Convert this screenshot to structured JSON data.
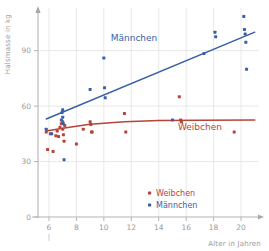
{
  "chart_data": {
    "type": "scatter",
    "title": "",
    "xlabel": "Alter in Jahren",
    "ylabel": "Halsmasse in kg",
    "xlim": [
      5.2,
      21.6
    ],
    "ylim": [
      0,
      112
    ],
    "xticks": [
      6,
      8,
      10,
      12,
      14,
      16,
      18,
      20
    ],
    "yticks": [
      0,
      30,
      60,
      90
    ],
    "grid": true,
    "legend_position": "bottom-center",
    "series": [
      {
        "name": "Weibchen",
        "color": "#b8433a",
        "marker": "square-dot",
        "annotation": "Weibchen",
        "annotation_x": 17.0,
        "annotation_y": 47.0,
        "points": [
          [
            5.8,
            46.0
          ],
          [
            5.9,
            36.5
          ],
          [
            6.1,
            45.0
          ],
          [
            6.3,
            35.5
          ],
          [
            6.5,
            44.0
          ],
          [
            6.6,
            46.5
          ],
          [
            6.7,
            43.5
          ],
          [
            6.8,
            48.5
          ],
          [
            6.9,
            50.5
          ],
          [
            7.0,
            51.5
          ],
          [
            7.0,
            47.5
          ],
          [
            7.05,
            44.5
          ],
          [
            7.1,
            41.0
          ],
          [
            7.15,
            49.5
          ],
          [
            8.0,
            39.5
          ],
          [
            8.5,
            47.5
          ],
          [
            9.0,
            51.5
          ],
          [
            9.05,
            50.0
          ],
          [
            9.1,
            46.0
          ],
          [
            9.15,
            46.0
          ],
          [
            11.5,
            56.0
          ],
          [
            11.6,
            46.0
          ],
          [
            15.5,
            65.0
          ],
          [
            15.6,
            52.5
          ],
          [
            15.65,
            51.5
          ],
          [
            19.5,
            46.0
          ]
        ],
        "trend": [
          [
            5.8,
            46.5
          ],
          [
            7.0,
            48.0
          ],
          [
            9.0,
            50.2
          ],
          [
            11.5,
            51.6
          ],
          [
            14.0,
            52.2
          ],
          [
            17.0,
            52.4
          ],
          [
            21.0,
            52.5
          ]
        ]
      },
      {
        "name": "Männchen",
        "color": "#3a5ea8",
        "marker": "square-dot",
        "annotation": "Männchen",
        "annotation_x": 12.2,
        "annotation_y": 95.0,
        "points": [
          [
            5.8,
            47.5
          ],
          [
            6.2,
            45.0
          ],
          [
            6.9,
            52.5
          ],
          [
            6.95,
            56.5
          ],
          [
            7.0,
            58.0
          ],
          [
            7.0,
            54.0
          ],
          [
            7.05,
            50.5
          ],
          [
            7.1,
            31.0
          ],
          [
            9.0,
            69.0
          ],
          [
            10.0,
            86.0
          ],
          [
            10.05,
            70.0
          ],
          [
            10.1,
            64.5
          ],
          [
            15.0,
            52.5
          ],
          [
            17.3,
            88.5
          ],
          [
            18.1,
            100.0
          ],
          [
            18.15,
            97.5
          ],
          [
            20.2,
            108.5
          ],
          [
            20.25,
            101.5
          ],
          [
            20.3,
            99.0
          ],
          [
            20.35,
            94.5
          ],
          [
            20.4,
            80.0
          ]
        ],
        "trend": [
          [
            5.8,
            53.0
          ],
          [
            21.0,
            100.0
          ]
        ]
      }
    ]
  },
  "legend": {
    "items": [
      {
        "label": "Weibchen",
        "color": "#b8433a"
      },
      {
        "label": "Männchen",
        "color": "#3a5ea8"
      }
    ]
  },
  "axes": {
    "x_title": "Alter in Jahren",
    "y_title": "Halsmasse in kg",
    "x_tick_labels": [
      "6",
      "8",
      "10",
      "12",
      "14",
      "16",
      "18",
      "20"
    ],
    "y_tick_labels": [
      "0",
      "30",
      "60",
      "90"
    ],
    "tick_color": "#9a9a9a",
    "grid_color": "#e2e2e2"
  }
}
